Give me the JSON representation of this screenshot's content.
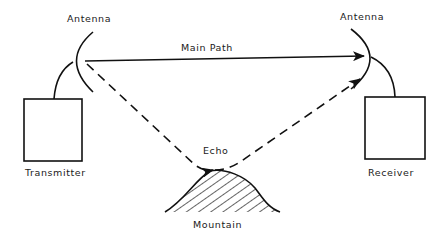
{
  "diagram": {
    "labels": {
      "antenna_left": "Antenna",
      "antenna_right": "Antenna",
      "main_path": "Main Path",
      "transmitter": "Transmitter",
      "receiver": "Receiver",
      "echo": "Echo",
      "mountain": "Mountain"
    },
    "colors": {
      "line": "#111111",
      "background": "#ffffff"
    }
  }
}
